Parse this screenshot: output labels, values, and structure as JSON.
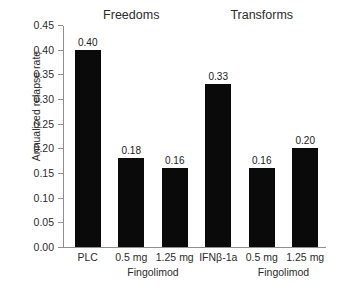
{
  "chart_data": {
    "type": "bar",
    "title": "",
    "xlabel": "",
    "ylabel": "Annualized relapse rate",
    "ylim": [
      0.0,
      0.45
    ],
    "grid": false,
    "legend": "none",
    "categories": [
      "PLC",
      "0.5 mg",
      "1.25 mg",
      "IFNβ-1a",
      "0.5 mg",
      "1.25 mg"
    ],
    "values": [
      0.4,
      0.18,
      0.16,
      0.33,
      0.16,
      0.2
    ],
    "data_labels": [
      "0.40",
      "0.18",
      "0.16",
      "0.33",
      "0.16",
      "0.20"
    ],
    "bar_color": "#0a0a0a",
    "y_ticks": [
      0.0,
      0.05,
      0.1,
      0.15,
      0.2,
      0.25,
      0.3,
      0.35,
      0.4,
      0.45
    ],
    "y_tick_labels": [
      "0.00",
      "0.05",
      "0.10",
      "0.15",
      "0.20",
      "0.25",
      "0.30",
      "0.35",
      "0.40",
      "0.45"
    ],
    "groups": [
      {
        "label": "Freedoms",
        "categories": [
          "PLC",
          "0.5 mg",
          "1.25 mg"
        ]
      },
      {
        "label": "Transforms",
        "categories": [
          "IFNβ-1a",
          "0.5 mg",
          "1.25 mg"
        ]
      }
    ],
    "sublabels": [
      {
        "label": "Fingolimod",
        "spans": [
          "0.5 mg",
          "1.25 mg"
        ],
        "group": "Freedoms"
      },
      {
        "label": "Fingolimod",
        "spans": [
          "0.5 mg",
          "1.25 mg"
        ],
        "group": "Transforms"
      }
    ]
  }
}
